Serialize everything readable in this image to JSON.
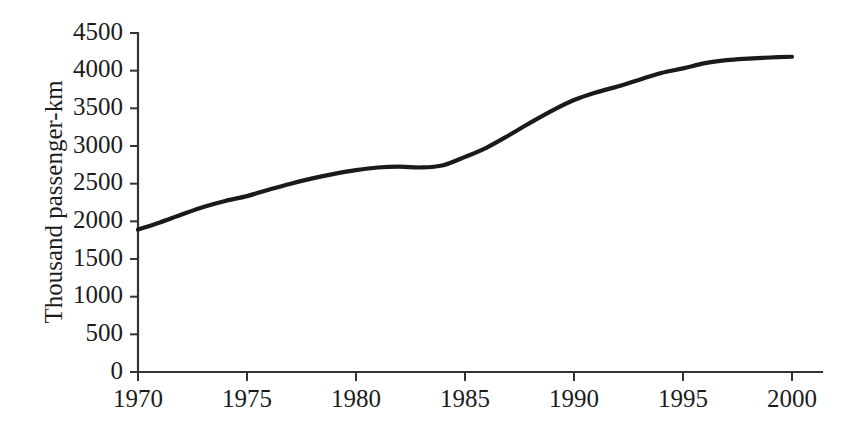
{
  "chart_data": {
    "type": "line",
    "title": "",
    "subtitle": "",
    "xlabel": "",
    "ylabel": "Thousand passenger-km",
    "xlim": [
      1970,
      2000
    ],
    "ylim": [
      0,
      4500
    ],
    "grid": false,
    "legend": null,
    "legend_position": "none",
    "x_ticks": [
      1970,
      1975,
      1980,
      1985,
      1990,
      1995,
      2000
    ],
    "x_tick_labels": [
      "1970",
      "1975",
      "1980",
      "1985",
      "1990",
      "1995",
      "2000"
    ],
    "y_ticks": [
      0,
      500,
      1000,
      1500,
      2000,
      2500,
      3000,
      3500,
      4000,
      4500
    ],
    "y_tick_labels": [
      "0",
      "500",
      "1000",
      "1500",
      "2000",
      "2500",
      "3000",
      "3500",
      "4000",
      "4500"
    ],
    "series": [
      {
        "name": "Thousand passenger-km",
        "color": "#1a1a1a",
        "x": [
          1970,
          1971,
          1972,
          1973,
          1974,
          1975,
          1976,
          1977,
          1978,
          1979,
          1980,
          1981,
          1982,
          1983,
          1984,
          1985,
          1986,
          1987,
          1988,
          1989,
          1990,
          1991,
          1992,
          1993,
          1994,
          1995,
          1996,
          1997,
          1998,
          1999,
          2000
        ],
        "values": [
          1890,
          1985,
          2090,
          2190,
          2270,
          2335,
          2420,
          2500,
          2570,
          2630,
          2680,
          2715,
          2725,
          2715,
          2745,
          2855,
          2980,
          3140,
          3310,
          3470,
          3610,
          3710,
          3790,
          3880,
          3970,
          4030,
          4100,
          4140,
          4160,
          4175,
          4185
        ]
      }
    ],
    "annotations": []
  },
  "axes": {
    "y_axis_title": "Thousand passenger-km",
    "x_axis_title": ""
  },
  "style": {
    "line_color": "#1a1a1a",
    "axis_color": "#333333",
    "text_color": "#1c1c1c",
    "background": "#ffffff"
  }
}
